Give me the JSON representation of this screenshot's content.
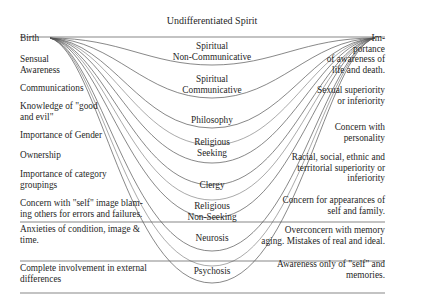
{
  "title": "Undifferentiated Spirit",
  "left_labels": [
    {
      "lines": [
        "Birth"
      ],
      "y": 33
    },
    {
      "lines": [
        "Sensual",
        "Awareness"
      ],
      "y": 54
    },
    {
      "lines": [
        "Communications"
      ],
      "y": 83
    },
    {
      "lines": [
        "Knowledge of \"good",
        "and evil\""
      ],
      "y": 101
    },
    {
      "lines": [
        "Importance of Gender"
      ],
      "y": 130
    },
    {
      "lines": [
        "Ownership"
      ],
      "y": 150
    },
    {
      "lines": [
        "Importance of category",
        "groupings"
      ],
      "y": 169
    },
    {
      "lines": [
        "Concern with \"self\" image blam-",
        "ing others for errors and failures."
      ],
      "y": 198
    },
    {
      "lines": [
        "Anxieties of condition, image &",
        "time."
      ],
      "y": 224
    },
    {
      "lines": [
        "Complete involvement in external",
        "differences"
      ],
      "y": 263
    }
  ],
  "center_labels": [
    {
      "lines": [
        "Spiritual",
        "Non-Communicative"
      ],
      "y": 41
    },
    {
      "lines": [
        "Spiritual",
        "Communicative"
      ],
      "y": 74
    },
    {
      "lines": [
        "Philosophy"
      ],
      "y": 115
    },
    {
      "lines": [
        "Religious",
        "Seeking"
      ],
      "y": 137
    },
    {
      "lines": [
        "Clergy"
      ],
      "y": 180
    },
    {
      "lines": [
        "Religious",
        "Non-Seeking"
      ],
      "y": 201
    },
    {
      "lines": [
        "Neurosis"
      ],
      "y": 233
    },
    {
      "lines": [
        "Psychosis"
      ],
      "y": 266
    }
  ],
  "right_labels": [
    {
      "lines": [
        "Im-",
        "portance",
        "of awareness of",
        "life and death."
      ],
      "y": 33
    },
    {
      "lines": [
        "Sexual superiority",
        "or inferiority"
      ],
      "y": 85
    },
    {
      "lines": [
        "Concern with",
        "personality"
      ],
      "y": 122
    },
    {
      "lines": [
        "Racial, social, ethnic and",
        "territorial superiority or",
        "inferiority"
      ],
      "y": 152
    },
    {
      "lines": [
        "Concern for appearances of",
        "self and family."
      ],
      "y": 195
    },
    {
      "lines": [
        "Overconcern with memory",
        "aging. Mistakes of real and ideal."
      ],
      "y": 225
    },
    {
      "lines": [
        "Awareness only of \"self\" and",
        "memories."
      ],
      "y": 259
    }
  ],
  "colors": {
    "ink": "#1f1f1f",
    "line": "#555555",
    "background": "#ffffff"
  }
}
